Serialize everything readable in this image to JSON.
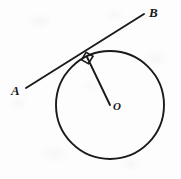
{
  "figure": {
    "background_color": "#fdfdfd",
    "stroke_color": "#1a1a1a",
    "canvas": {
      "width": 181,
      "height": 179
    }
  },
  "labels": {
    "point_a": "A",
    "point_b": "B",
    "center_o": "O"
  },
  "geometry": {
    "circle": {
      "name": "circle",
      "cx": 110,
      "cy": 105,
      "r": 54,
      "stroke_width": 1.9,
      "fill": "none"
    },
    "tangent_line": {
      "name": "tangent-line-ab",
      "x1": 26,
      "y1": 88,
      "x2": 144,
      "y2": 14,
      "stroke_width": 1.9
    },
    "radius_line": {
      "name": "radius-to-tangent-point",
      "x1": 87,
      "y1": 57,
      "x2": 110,
      "y2": 105,
      "stroke_width": 1.9
    },
    "tangent_point": {
      "x": 87,
      "y": 57
    },
    "right_angle_marker": {
      "name": "right-angle-square",
      "size": 9,
      "stroke_width": 1.6,
      "points": "81.4,59.8 86.1,52.3 93.0,56.2 88.4,63.6"
    }
  },
  "annotations": {
    "angle_measure": "90°",
    "relationship": "radius ⟂ tangent"
  }
}
